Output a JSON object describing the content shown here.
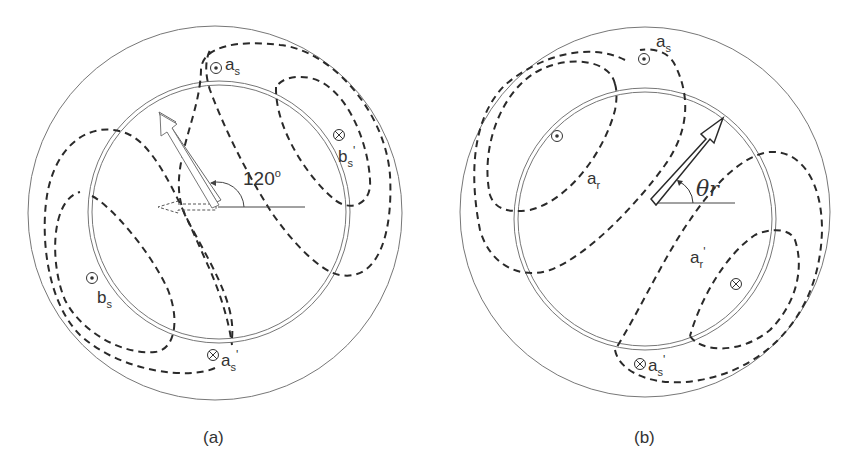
{
  "figure": {
    "panels": [
      {
        "id": "a",
        "caption": "(a)",
        "angle_label": "120",
        "angle_unit": "o",
        "labels": {
          "a_s": {
            "base": "a",
            "sub": "s",
            "prime": ""
          },
          "a_s_prime": {
            "base": "a",
            "sub": "s",
            "prime": "'"
          },
          "b_s": {
            "base": "b",
            "sub": "s",
            "prime": ""
          },
          "b_s_prime": {
            "base": "b",
            "sub": "s",
            "prime": "'"
          }
        },
        "symbols": {
          "dot": "⊙",
          "cross": "⊗"
        }
      },
      {
        "id": "b",
        "caption": "(b)",
        "angle_symbol": "θ",
        "angle_sub": "r",
        "labels": {
          "a_s": {
            "base": "a",
            "sub": "s",
            "prime": ""
          },
          "a_s_prime": {
            "base": "a",
            "sub": "s",
            "prime": "'"
          },
          "a_r": {
            "base": "a",
            "sub": "r",
            "prime": ""
          },
          "a_r_prime": {
            "base": "a",
            "sub": "r",
            "prime": "'"
          }
        }
      }
    ],
    "colors": {
      "stroke": "#2a2a2a",
      "thin": "#777777",
      "text": "#333333"
    }
  }
}
